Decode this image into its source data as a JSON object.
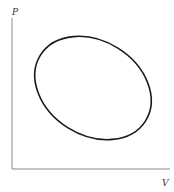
{
  "diagram": {
    "type": "pv-cycle",
    "y_axis_label": "P",
    "x_axis_label": "V",
    "curve": "closed elliptical cycle",
    "colors": {
      "axis": "#8a8a8a",
      "curve": "#1a1a1a",
      "background": "#ffffff"
    }
  }
}
